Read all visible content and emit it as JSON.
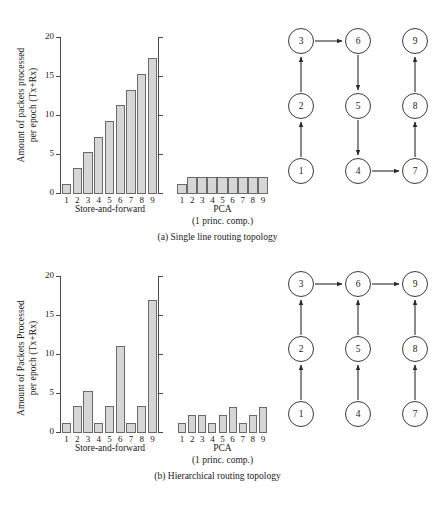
{
  "figure": {
    "panels": [
      {
        "id": "a",
        "caption": "(a) Single line routing topology",
        "ylabel_line1": "Amount of packets processed",
        "ylabel_line2": "per epoch  (Tx+Rx)",
        "group1_label": "Store-and-forward",
        "group2_label": "PCA",
        "group2_sublabel": "(1 princ. comp.)"
      },
      {
        "id": "b",
        "caption": "(b) Hierarchical routing topology",
        "ylabel_line1": "Amount of Packets Processed",
        "ylabel_line2": "per epoch  (Tx+Rx)",
        "group1_label": "Store-and-forward",
        "group2_label": "PCA",
        "group2_sublabel": "(1 princ. comp.)"
      }
    ]
  },
  "chart_data": [
    {
      "type": "bar",
      "panel": "a",
      "group": "Store-and-forward",
      "title": "(a) Single line routing topology",
      "xlabel": "Store-and-forward",
      "ylabel": "Amount of packets processed per epoch (Tx+Rx)",
      "categories": [
        "1",
        "2",
        "3",
        "4",
        "5",
        "6",
        "7",
        "8",
        "9"
      ],
      "values": [
        1.3,
        3.3,
        5.3,
        7.3,
        9.3,
        11.3,
        13.3,
        15.3,
        17.3
      ],
      "ylim": [
        0,
        20
      ],
      "yticks": [
        0,
        5,
        10,
        15,
        20
      ],
      "grid": false,
      "legend": "none",
      "bar_fill": "#d6d6d6",
      "bar_edge": "#6a6a6a"
    },
    {
      "type": "bar",
      "panel": "a",
      "group": "PCA",
      "title": "(a) Single line routing topology",
      "xlabel": "PCA (1 princ. comp.)",
      "ylabel": "Amount of packets processed per epoch (Tx+Rx)",
      "categories": [
        "1",
        "2",
        "3",
        "4",
        "5",
        "6",
        "7",
        "8",
        "9"
      ],
      "values": [
        1.3,
        2.2,
        2.2,
        2.2,
        2.2,
        2.2,
        2.2,
        2.2,
        2.2
      ],
      "ylim": [
        0,
        20
      ],
      "yticks": [
        0,
        5,
        10,
        15,
        20
      ],
      "grid": false,
      "legend": "none",
      "bar_fill": "#d6d6d6",
      "bar_edge": "#6a6a6a"
    },
    {
      "type": "bar",
      "panel": "b",
      "group": "Store-and-forward",
      "title": "(b) Hierarchical routing topology",
      "xlabel": "Store-and-forward",
      "ylabel": "Amount of Packets Processed per epoch (Tx+Rx)",
      "categories": [
        "1",
        "2",
        "3",
        "4",
        "5",
        "6",
        "7",
        "8",
        "9"
      ],
      "values": [
        1.3,
        3.4,
        5.3,
        1.3,
        3.4,
        11.1,
        1.3,
        3.4,
        16.9
      ],
      "ylim": [
        0,
        20
      ],
      "yticks": [
        0,
        5,
        10,
        15,
        20
      ],
      "grid": false,
      "legend": "none",
      "bar_fill": "#d6d6d6",
      "bar_edge": "#6a6a6a"
    },
    {
      "type": "bar",
      "panel": "b",
      "group": "PCA",
      "title": "(b) Hierarchical routing topology",
      "xlabel": "PCA (1 princ. comp.)",
      "ylabel": "Amount of Packets Processed per epoch (Tx+Rx)",
      "categories": [
        "1",
        "2",
        "3",
        "4",
        "5",
        "6",
        "7",
        "8",
        "9"
      ],
      "values": [
        1.3,
        2.3,
        2.3,
        1.3,
        2.3,
        3.3,
        1.3,
        2.3,
        3.3
      ],
      "ylim": [
        0,
        20
      ],
      "yticks": [
        0,
        5,
        10,
        15,
        20
      ],
      "grid": false,
      "legend": "none",
      "bar_fill": "#d6d6d6",
      "bar_edge": "#6a6a6a"
    }
  ],
  "graphs": [
    {
      "panel": "a",
      "description": "Single line routing topology",
      "nodes": [
        "1",
        "2",
        "3",
        "4",
        "5",
        "6",
        "7",
        "8",
        "9"
      ],
      "edges": [
        {
          "from": "1",
          "to": "2"
        },
        {
          "from": "2",
          "to": "3"
        },
        {
          "from": "3",
          "to": "6"
        },
        {
          "from": "6",
          "to": "5"
        },
        {
          "from": "5",
          "to": "4"
        },
        {
          "from": "4",
          "to": "7"
        },
        {
          "from": "7",
          "to": "8"
        },
        {
          "from": "8",
          "to": "9"
        }
      ]
    },
    {
      "panel": "b",
      "description": "Hierarchical routing topology",
      "nodes": [
        "1",
        "2",
        "3",
        "4",
        "5",
        "6",
        "7",
        "8",
        "9"
      ],
      "edges": [
        {
          "from": "1",
          "to": "2"
        },
        {
          "from": "2",
          "to": "3"
        },
        {
          "from": "4",
          "to": "5"
        },
        {
          "from": "5",
          "to": "6"
        },
        {
          "from": "7",
          "to": "8"
        },
        {
          "from": "8",
          "to": "9"
        },
        {
          "from": "3",
          "to": "6"
        },
        {
          "from": "6",
          "to": "9"
        }
      ]
    }
  ],
  "axis": {
    "tick_labels": [
      "20",
      "15",
      "10",
      "5",
      "0"
    ],
    "category_labels": [
      "1",
      "2",
      "3",
      "4",
      "5",
      "6",
      "7",
      "8",
      "9"
    ]
  }
}
